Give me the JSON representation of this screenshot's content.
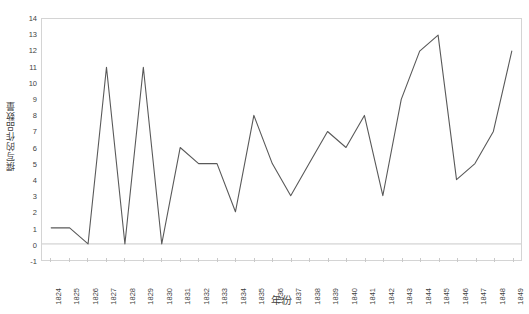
{
  "chart_data": {
    "type": "line",
    "title": "",
    "xlabel": "年份",
    "ylabel": "撰写的作品数量",
    "categories": [
      "1824",
      "1825",
      "1826",
      "1827",
      "1828",
      "1829",
      "1830",
      "1831",
      "1832",
      "1833",
      "1834",
      "1835",
      "1836",
      "1837",
      "1838",
      "1839",
      "1840",
      "1841",
      "1842",
      "1843",
      "1844",
      "1845",
      "1846",
      "1847",
      "1848",
      "1849"
    ],
    "values": [
      1,
      1,
      0,
      11,
      0,
      11,
      0,
      6,
      5,
      5,
      2,
      8,
      5,
      3,
      5,
      7,
      6,
      8,
      3,
      9,
      12,
      13,
      4,
      5,
      7,
      12
    ],
    "series": [
      {
        "name": "撰写的作品数量",
        "values": [
          1,
          1,
          0,
          11,
          0,
          11,
          0,
          6,
          5,
          5,
          2,
          8,
          5,
          3,
          5,
          7,
          6,
          8,
          3,
          9,
          12,
          13,
          4,
          5,
          7,
          12
        ]
      }
    ],
    "ylim": [
      -1,
      14
    ],
    "ytick_labels": [
      "14",
      "13",
      "12",
      "11",
      "10",
      "9",
      "8",
      "7",
      "6",
      "5",
      "4",
      "3",
      "2",
      "1",
      "0",
      "-1"
    ],
    "ytick_values": [
      14,
      13,
      12,
      11,
      10,
      9,
      8,
      7,
      6,
      5,
      4,
      3,
      2,
      1,
      0,
      -1
    ],
    "grid": false,
    "zero_baseline": true,
    "legend": "none",
    "line_color": "#595959",
    "baseline_color": "#c9c9c9",
    "border_color": "#d4d4d4",
    "background_color": "#ffffff",
    "text_color": "#3f3f3f"
  }
}
